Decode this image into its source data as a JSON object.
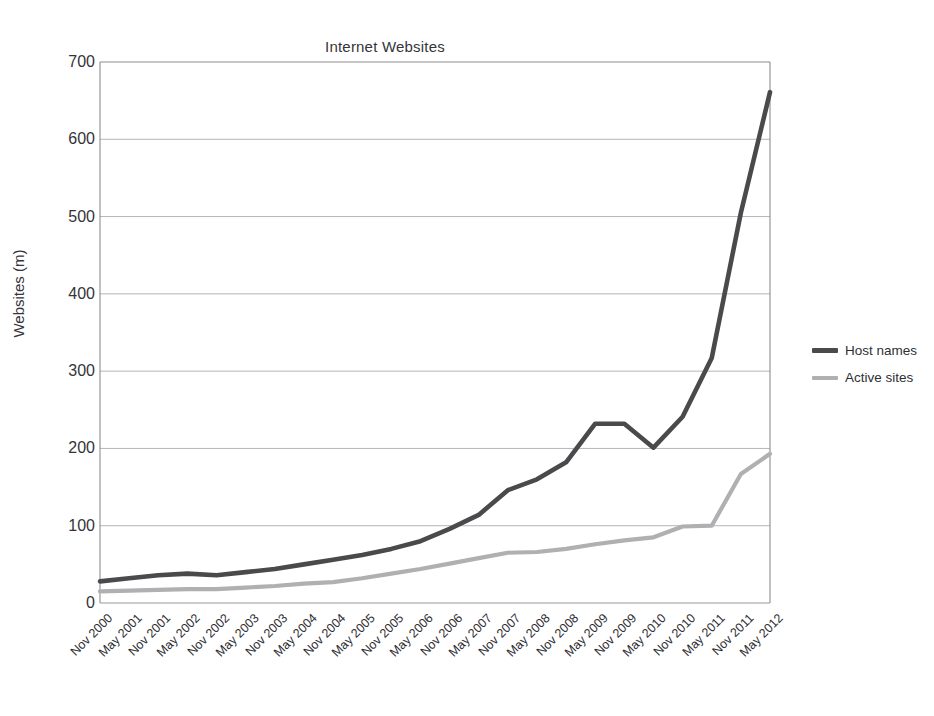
{
  "chart_data": {
    "type": "line",
    "title": "Internet Websites",
    "xlabel": "",
    "ylabel": "Websites (m)",
    "ylim": [
      0,
      700
    ],
    "yticks": [
      0,
      100,
      200,
      300,
      400,
      500,
      600,
      700
    ],
    "grid": "horizontal",
    "legend_position": "right",
    "categories": [
      "Nov 2000",
      "May 2001",
      "Nov 2001",
      "May 2002",
      "Nov 2002",
      "May 2003",
      "Nov 2003",
      "May 2004",
      "Nov 2004",
      "May 2005",
      "Nov 2005",
      "May 2006",
      "Nov 2006",
      "May 2007",
      "Nov 2007",
      "May 2008",
      "Nov 2008",
      "May 2009",
      "Nov 2009",
      "May 2010",
      "Nov 2010",
      "May 2011",
      "Nov 2011",
      "May 2012"
    ],
    "series": [
      {
        "name": "Host names",
        "color": "#4a4a4d",
        "values": [
          28,
          32,
          36,
          38,
          36,
          40,
          44,
          50,
          56,
          62,
          70,
          80,
          96,
          114,
          146,
          160,
          182,
          232,
          232,
          201,
          241,
          317,
          505,
          661
        ]
      },
      {
        "name": "Active sites",
        "color": "#b0b0b2",
        "values": [
          15,
          16,
          17,
          18,
          18,
          20,
          22,
          25,
          27,
          32,
          38,
          44,
          51,
          58,
          65,
          66,
          70,
          76,
          81,
          85,
          99,
          100,
          167,
          193
        ]
      }
    ]
  },
  "legend": {
    "items": [
      {
        "label": "Host names",
        "color": "#4a4a4d"
      },
      {
        "label": "Active sites",
        "color": "#b0b0b2"
      }
    ]
  },
  "axes": {
    "y_title": "Websites (m)",
    "y_ticks": [
      "700",
      "600",
      "500",
      "400",
      "300",
      "200",
      "100",
      "0"
    ]
  }
}
